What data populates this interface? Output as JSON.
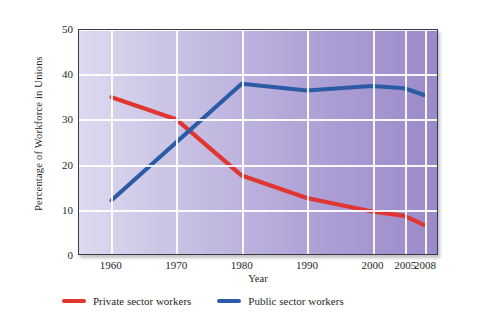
{
  "chart_data": {
    "type": "line",
    "title": "",
    "xlabel": "Year",
    "ylabel": "Percentage of Workforce in Unions",
    "x": [
      1960,
      1970,
      1980,
      1990,
      2000,
      2005,
      2008
    ],
    "xlim": [
      1955,
      2010
    ],
    "ylim": [
      0,
      50
    ],
    "yticks": [
      0,
      10,
      20,
      30,
      40,
      50
    ],
    "xticks": [
      "1960",
      "1970",
      "1980",
      "1990",
      "2000",
      "2005",
      "2008"
    ],
    "grid": true,
    "legend_position": "below",
    "series": [
      {
        "name": "Private sector workers",
        "color": "#e03530",
        "values": [
          35,
          30,
          17.5,
          12.5,
          9.5,
          8.5,
          6.5
        ]
      },
      {
        "name": "Public sector workers",
        "color": "#2c5ba6",
        "values": [
          12,
          25,
          38,
          36.5,
          37.5,
          37,
          35.5
        ]
      }
    ]
  },
  "legend": {
    "items": [
      {
        "label": "Private sector workers",
        "color": "#e03530"
      },
      {
        "label": "Public sector workers",
        "color": "#2c5ba6"
      }
    ]
  },
  "axes": {
    "y_title": "Percentage of Workforce in Unions",
    "x_title": "Year",
    "y_tick_labels": [
      "50",
      "40",
      "30",
      "20",
      "10",
      "0"
    ],
    "x_tick_labels": [
      "1960",
      "1970",
      "1980",
      "1990",
      "2000",
      "2005",
      "2008"
    ]
  }
}
